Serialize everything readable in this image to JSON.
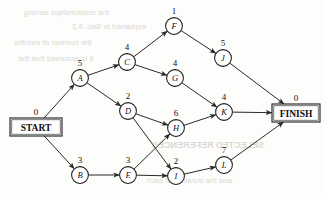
{
  "diagram": {
    "type": "activity-on-node",
    "start": {
      "label": "START",
      "duration": "0"
    },
    "finish": {
      "label": "FINISH",
      "duration": "0"
    },
    "nodes": [
      {
        "id": "A",
        "label": "A",
        "duration": "5",
        "x": 80,
        "y": 78
      },
      {
        "id": "B",
        "label": "B",
        "duration": "3",
        "x": 80,
        "y": 175
      },
      {
        "id": "C",
        "label": "C",
        "duration": "4",
        "x": 127,
        "y": 62
      },
      {
        "id": "D",
        "label": "D",
        "duration": "2",
        "x": 128,
        "y": 111
      },
      {
        "id": "E",
        "label": "E",
        "duration": "3",
        "x": 128,
        "y": 175
      },
      {
        "id": "F",
        "label": "F",
        "duration": "1",
        "x": 174,
        "y": 26
      },
      {
        "id": "G",
        "label": "G",
        "duration": "4",
        "x": 175,
        "y": 78
      },
      {
        "id": "H",
        "label": "H",
        "duration": "6",
        "x": 176,
        "y": 128
      },
      {
        "id": "I",
        "label": "I",
        "duration": "2",
        "x": 176,
        "y": 176
      },
      {
        "id": "J",
        "label": "J",
        "duration": "5",
        "x": 223,
        "y": 58
      },
      {
        "id": "K",
        "label": "K",
        "duration": "4",
        "x": 224,
        "y": 112
      },
      {
        "id": "L",
        "label": "L",
        "duration": "7",
        "x": 224,
        "y": 165
      }
    ],
    "edges": [
      {
        "from": "START",
        "to": "A"
      },
      {
        "from": "START",
        "to": "B"
      },
      {
        "from": "A",
        "to": "C"
      },
      {
        "from": "A",
        "to": "D"
      },
      {
        "from": "B",
        "to": "E"
      },
      {
        "from": "C",
        "to": "F"
      },
      {
        "from": "C",
        "to": "G"
      },
      {
        "from": "D",
        "to": "H"
      },
      {
        "from": "D",
        "to": "I"
      },
      {
        "from": "E",
        "to": "H"
      },
      {
        "from": "E",
        "to": "I"
      },
      {
        "from": "F",
        "to": "J"
      },
      {
        "from": "G",
        "to": "K"
      },
      {
        "from": "H",
        "to": "K"
      },
      {
        "from": "I",
        "to": "L"
      },
      {
        "from": "J",
        "to": "FINISH"
      },
      {
        "from": "K",
        "to": "FINISH"
      },
      {
        "from": "L",
        "to": "FINISH"
      }
    ],
    "geometry": {
      "node_radius": 8.4,
      "start_box": {
        "x": 10,
        "y": 118,
        "w": 52,
        "h": 18
      },
      "finish_box": {
        "x": 272,
        "y": 104,
        "w": 48,
        "h": 18
      }
    },
    "colors": {
      "ink": "#1b1b1b",
      "paper": "#fdfdfc",
      "edge": "#2a2a2a"
    }
  },
  "bleed": {
    "lines": [
      {
        "text": "the relationships among",
        "x": 24,
        "y": 8,
        "size": 8
      },
      {
        "text": "explained in Sec. 9.2",
        "x": 72,
        "y": 22,
        "size": 8
      },
      {
        "text": "the number of months",
        "x": 14,
        "y": 38,
        "size": 8
      },
      {
        "text": "it is assumed that the",
        "x": 18,
        "y": 54,
        "size": 8
      },
      {
        "text": "SELECTED REFERENCES",
        "x": 152,
        "y": 140,
        "size": 9
      },
      {
        "text": "and the duration of each",
        "x": 146,
        "y": 176,
        "size": 8
      }
    ]
  }
}
